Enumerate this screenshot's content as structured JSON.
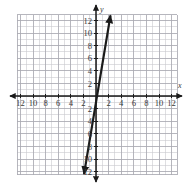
{
  "figure": {
    "title": "",
    "axis_labels": {
      "x": "x",
      "y": "y"
    }
  },
  "chart_data": {
    "type": "line",
    "title": "",
    "xlabel": "x",
    "ylabel": "y",
    "grid": true,
    "legend": "none",
    "xlim": [
      -13,
      13
    ],
    "ylim": [
      -13,
      13
    ],
    "xticks": [
      -12,
      -10,
      -8,
      -6,
      -4,
      -2,
      2,
      4,
      6,
      8,
      10,
      12
    ],
    "yticks": [
      -12,
      -10,
      -8,
      -6,
      -4,
      -2,
      2,
      4,
      6,
      8,
      10,
      12
    ],
    "xtick_labels": [
      "12",
      "10",
      "8",
      "6",
      "4",
      "2",
      "2",
      "4",
      "6",
      "8",
      "10",
      "12"
    ],
    "ytick_labels": [
      "12",
      "10",
      "8",
      "6",
      "4",
      "2",
      "2",
      "4",
      "6",
      "8",
      "10",
      "12"
    ],
    "grid_step": 1,
    "major_step": 2,
    "series": [
      {
        "name": "line",
        "type": "line",
        "slope": 6,
        "intercept": -1,
        "x": [
          -1.9,
          2.3
        ],
        "y": [
          -12.4,
          12.8
        ],
        "arrows": "both",
        "color": "#1a1a1a",
        "width": 2.2
      }
    ],
    "annotations": []
  },
  "ticks": {
    "x_negative": [
      "12",
      "10",
      "8",
      "6",
      "4",
      "2"
    ],
    "x_positive": [
      "2",
      "4",
      "6",
      "8",
      "10",
      "12"
    ],
    "y_positive": [
      "2",
      "4",
      "6",
      "8",
      "10",
      "12"
    ],
    "y_negative": [
      "2",
      "4",
      "6",
      "8",
      "10",
      "12"
    ]
  },
  "colors": {
    "grid_minor": "#c9c9cf",
    "grid_major": "#a9a9b2",
    "axis": "#1a1a1a",
    "line": "#1a1a1a",
    "label": "#3a3a3a",
    "background": "#ffffff"
  }
}
